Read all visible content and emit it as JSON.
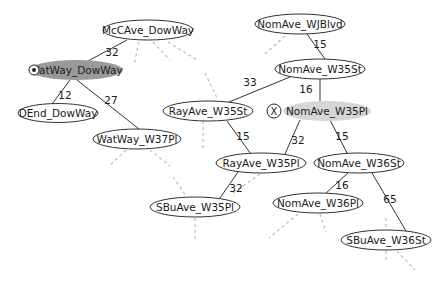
{
  "diagram": {
    "type": "road-network-graph",
    "colors": {
      "background": "#ffffff",
      "node_stroke": "#333333",
      "edge": "#333333",
      "dashed_edge": "#bbbbbb",
      "current_fill": "#9a9a9a",
      "target_fill": "#d6d6d6"
    },
    "nodes": [
      {
        "id": "McCAve_DowWay",
        "label": "McCAve_DowWay",
        "cx": 148,
        "cy": 30,
        "rx": 45,
        "ry": 10,
        "state": "normal"
      },
      {
        "id": "WatWay_DowWay",
        "label": "WatWay_DowWay",
        "cx": 76,
        "cy": 70,
        "rx": 47,
        "ry": 10,
        "state": "current",
        "marker": "start-icon"
      },
      {
        "id": "DEnd_DowWay",
        "label": "DEnd_DowWay",
        "cx": 58,
        "cy": 113,
        "rx": 40,
        "ry": 9.5,
        "state": "normal"
      },
      {
        "id": "WatWay_W37Pl",
        "label": "WatWay_W37Pl",
        "cx": 137,
        "cy": 139,
        "rx": 44,
        "ry": 10,
        "state": "normal"
      },
      {
        "id": "NomAve_WJBlvd",
        "label": "NomAve_WJBlvd",
        "cx": 300,
        "cy": 24,
        "rx": 45,
        "ry": 10,
        "state": "normal"
      },
      {
        "id": "NomAve_W35St",
        "label": "NomAve_W35St",
        "cx": 320,
        "cy": 69,
        "rx": 45,
        "ry": 10,
        "state": "normal"
      },
      {
        "id": "RayAve_W35St",
        "label": "RayAve_W35St",
        "cx": 208,
        "cy": 111,
        "rx": 45,
        "ry": 10,
        "state": "normal"
      },
      {
        "id": "NomAve_W35Pl",
        "label": "NomAve_W35Pl",
        "cx": 327,
        "cy": 111,
        "rx": 44,
        "ry": 10,
        "state": "target",
        "marker": "x-icon"
      },
      {
        "id": "RayAve_W35Pl",
        "label": "RayAve_W35Pl",
        "cx": 261,
        "cy": 163,
        "rx": 45,
        "ry": 10,
        "state": "normal"
      },
      {
        "id": "NomAve_W36St",
        "label": "NomAve_W36St",
        "cx": 359,
        "cy": 163,
        "rx": 45,
        "ry": 10,
        "state": "normal"
      },
      {
        "id": "SBuAve_W35Pl",
        "label": "SBuAve_W35Pl",
        "cx": 195,
        "cy": 207,
        "rx": 45,
        "ry": 10,
        "state": "normal"
      },
      {
        "id": "NomAve_W36Pl",
        "label": "NomAve_W36Pl",
        "cx": 318,
        "cy": 203,
        "rx": 45,
        "ry": 10,
        "state": "normal"
      },
      {
        "id": "SBuAve_W36St",
        "label": "SBuAve_W36St",
        "cx": 386,
        "cy": 240,
        "rx": 45,
        "ry": 10,
        "state": "normal"
      }
    ],
    "edges": [
      {
        "from": "McCAve_DowWay",
        "to": "WatWay_DowWay",
        "weight": "32",
        "x1": 127,
        "y1": 40,
        "x2": 88,
        "y2": 61,
        "lx": 112,
        "ly": 56
      },
      {
        "from": "WatWay_DowWay",
        "to": "DEnd_DowWay",
        "weight": "12",
        "x1": 70,
        "y1": 80,
        "x2": 52,
        "y2": 104,
        "lx": 65,
        "ly": 99
      },
      {
        "from": "WatWay_DowWay",
        "to": "WatWay_W37Pl",
        "weight": "27",
        "x1": 77,
        "y1": 80,
        "x2": 139,
        "y2": 129,
        "lx": 111,
        "ly": 104
      },
      {
        "from": "NomAve_WJBlvd",
        "to": "NomAve_W35St",
        "weight": "15",
        "x1": 307,
        "y1": 34,
        "x2": 325,
        "y2": 59,
        "lx": 320,
        "ly": 48
      },
      {
        "from": "NomAve_W35St",
        "to": "RayAve_W35St",
        "weight": "33",
        "x1": 290,
        "y1": 77,
        "x2": 229,
        "y2": 102,
        "lx": 250,
        "ly": 86
      },
      {
        "from": "NomAve_W35St",
        "to": "NomAve_W35Pl",
        "weight": "16",
        "x1": 320,
        "y1": 79,
        "x2": 320,
        "y2": 101,
        "lx": 306,
        "ly": 93
      },
      {
        "from": "RayAve_W35St",
        "to": "RayAve_W35Pl",
        "weight": "15",
        "x1": 227,
        "y1": 121,
        "x2": 251,
        "y2": 154,
        "lx": 243,
        "ly": 140
      },
      {
        "from": "NomAve_W35Pl",
        "to": "RayAve_W35Pl",
        "weight": "32",
        "x1": 300,
        "y1": 120,
        "x2": 285,
        "y2": 154,
        "lx": 298,
        "ly": 144
      },
      {
        "from": "NomAve_W35Pl",
        "to": "NomAve_W36St",
        "weight": "15",
        "x1": 330,
        "y1": 120,
        "x2": 347,
        "y2": 153,
        "lx": 342,
        "ly": 140
      },
      {
        "from": "RayAve_W35Pl",
        "to": "SBuAve_W35Pl",
        "weight": "32",
        "x1": 238,
        "y1": 172,
        "x2": 220,
        "y2": 198,
        "lx": 236,
        "ly": 192
      },
      {
        "from": "NomAve_W36St",
        "to": "NomAve_W36Pl",
        "weight": "16",
        "x1": 348,
        "y1": 173,
        "x2": 325,
        "y2": 194,
        "lx": 342,
        "ly": 189
      },
      {
        "from": "NomAve_W36St",
        "to": "SBuAve_W36St",
        "weight": "65",
        "x1": 372,
        "y1": 173,
        "x2": 406,
        "y2": 231,
        "lx": 390,
        "ly": 203
      }
    ],
    "dashed_edges": [
      {
        "x1": 139,
        "y1": 42,
        "x2": 134,
        "y2": 65
      },
      {
        "x1": 153,
        "y1": 42,
        "x2": 170,
        "y2": 60
      },
      {
        "x1": 168,
        "y1": 42,
        "x2": 197,
        "y2": 60
      },
      {
        "x1": 205,
        "y1": 73,
        "x2": 218,
        "y2": 100
      },
      {
        "x1": 126,
        "y1": 150,
        "x2": 110,
        "y2": 165
      },
      {
        "x1": 150,
        "y1": 150,
        "x2": 170,
        "y2": 166
      },
      {
        "x1": 173,
        "y1": 177,
        "x2": 186,
        "y2": 196
      },
      {
        "x1": 195,
        "y1": 218,
        "x2": 195,
        "y2": 241
      },
      {
        "x1": 203,
        "y1": 121,
        "x2": 203,
        "y2": 150
      },
      {
        "x1": 285,
        "y1": 36,
        "x2": 265,
        "y2": 54
      },
      {
        "x1": 298,
        "y1": 214,
        "x2": 269,
        "y2": 238
      },
      {
        "x1": 320,
        "y1": 214,
        "x2": 326,
        "y2": 232
      },
      {
        "x1": 386,
        "y1": 218,
        "x2": 386,
        "y2": 230
      },
      {
        "x1": 386,
        "y1": 251,
        "x2": 386,
        "y2": 263
      },
      {
        "x1": 397,
        "y1": 251,
        "x2": 415,
        "y2": 270
      },
      {
        "x1": 260,
        "y1": 174,
        "x2": 233,
        "y2": 193
      }
    ],
    "markers": {
      "start": {
        "node": "WatWay_DowWay",
        "icon": "radio-dot-icon",
        "cx": 34,
        "cy": 70,
        "r": 5
      },
      "target": {
        "node": "NomAve_W35Pl",
        "icon": "x-circle-icon",
        "label": "X",
        "cx": 274,
        "cy": 111,
        "r": 7
      }
    }
  }
}
